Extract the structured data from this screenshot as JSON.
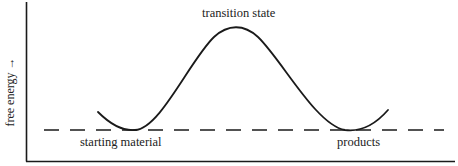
{
  "diagram": {
    "type": "reaction-energy-profile",
    "y_axis_label": "free energy →",
    "labels": {
      "peak": "transition state",
      "left_minimum": "starting material",
      "right_minimum": "products"
    },
    "reference_line": {
      "style": "dashed",
      "meaning": "equal free energy of starting material and products"
    },
    "colors": {
      "line": "#1a1a1a",
      "background": "#ffffff"
    }
  }
}
